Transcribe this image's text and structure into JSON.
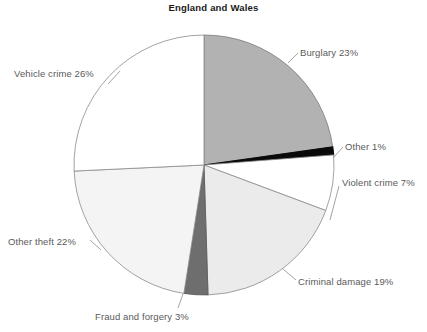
{
  "chart_data": {
    "type": "pie",
    "title": "England and Wales",
    "xlabel": "",
    "ylabel": "",
    "legend_position": "none",
    "grid": false,
    "start_angle_deg": 0,
    "direction": "clockwise",
    "center": {
      "x": 204,
      "y": 165
    },
    "radius": 130,
    "categories": [
      "Burglary",
      "Other",
      "Violent crime",
      "Criminal damage",
      "Fraud and forgery",
      "Other theft",
      "Vehicle crime"
    ],
    "values": [
      23,
      1,
      7,
      19,
      3,
      22,
      26
    ],
    "unit": "%",
    "slices": [
      {
        "name": "Burglary",
        "value": 23,
        "label": "Burglary 23%",
        "color": "#b2b2b2",
        "stroke": "#7a7a7a"
      },
      {
        "name": "Other",
        "value": 1,
        "label": "Other 1%",
        "color": "#0a0a0a",
        "stroke": "#0a0a0a"
      },
      {
        "name": "Violent crime",
        "value": 7,
        "label": "Violent crime 7%",
        "color": "#ffffff",
        "stroke": "#8c8c8c"
      },
      {
        "name": "Criminal damage",
        "value": 19,
        "label": "Criminal damage 19%",
        "color": "#ebebeb",
        "stroke": "#8c8c8c"
      },
      {
        "name": "Fraud and forgery",
        "value": 3,
        "label": "Fraud and forgery 3%",
        "color": "#6e6e6e",
        "stroke": "#5a5a5a"
      },
      {
        "name": "Other theft",
        "value": 22,
        "label": "Other theft 22%",
        "color": "#f4f4f4",
        "stroke": "#8c8c8c"
      },
      {
        "name": "Vehicle crime",
        "value": 26,
        "label": "Vehicle crime 26%",
        "color": "#ffffff",
        "stroke": "#8c8c8c"
      }
    ],
    "leader_lines": [
      {
        "for": "Burglary",
        "from": {
          "x": 288,
          "y": 63
        },
        "to": {
          "x": 298,
          "y": 53
        }
      },
      {
        "for": "Other",
        "from": {
          "x": 333,
          "y": 158
        },
        "to": {
          "x": 343,
          "y": 147
        }
      },
      {
        "for": "Violent crime",
        "from": {
          "x": 330,
          "y": 220
        },
        "to": {
          "x": 339,
          "y": 186
        }
      },
      {
        "for": "Criminal damage",
        "from": {
          "x": 283,
          "y": 269
        },
        "to": {
          "x": 296,
          "y": 280
        }
      },
      {
        "for": "Fraud and forgery",
        "from": {
          "x": 183,
          "y": 294
        },
        "to": {
          "x": 178,
          "y": 308
        }
      },
      {
        "for": "Other theft",
        "from": {
          "x": 101,
          "y": 250
        },
        "to": {
          "x": 90,
          "y": 240
        }
      },
      {
        "for": "Vehicle crime",
        "from": {
          "x": 120,
          "y": 71
        },
        "to": {
          "x": 108,
          "y": 84
        }
      }
    ]
  },
  "chart": {
    "title": "England and Wales",
    "labels": {
      "burglary": "Burglary 23%",
      "other": "Other 1%",
      "violent_crime": "Violent crime 7%",
      "criminal_damage": "Criminal damage 19%",
      "fraud_and_forgery": "Fraud and forgery 3%",
      "other_theft": "Other theft 22%",
      "vehicle_crime": "Vehicle crime 26%"
    }
  }
}
